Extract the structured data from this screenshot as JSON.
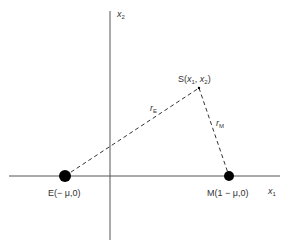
{
  "diagram": {
    "axes": {
      "x1_label": "x",
      "x1_sub": "1",
      "x2_label": "x",
      "x2_sub": "2"
    },
    "points": {
      "earth": {
        "prefix": "E(",
        "coords": "− μ,0)",
        "full": "E(− μ,0)"
      },
      "moon": {
        "prefix": "M(",
        "coords": "1 − μ,0)",
        "full": "M(1 − μ,0)"
      },
      "satellite": {
        "full": "S(x1, x2)",
        "s": "S(",
        "x": "x",
        "sub1": "1",
        "comma": ", ",
        "sub2": "2",
        "close": ")"
      }
    },
    "distances": {
      "r_E": {
        "r": "r",
        "sub": "E"
      },
      "r_M": {
        "r": "r",
        "sub": "M"
      }
    },
    "colors": {
      "axis": "#555555",
      "dash": "#333333",
      "body": "#000000",
      "text": "#333333"
    }
  }
}
